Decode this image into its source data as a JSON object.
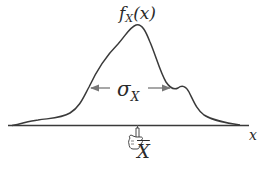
{
  "diagram": {
    "type": "probability-density-curve",
    "labels": {
      "density_function": "f",
      "density_subscript": "X",
      "density_argument": "(x)",
      "spread_symbol": "σ",
      "spread_subscript": "X",
      "axis_variable": "x",
      "mean_symbol": "X"
    },
    "marker": {
      "icon": "pointing-hand-icon",
      "points_to": "mean"
    },
    "colors": {
      "curve": "#3a3a3a",
      "axis": "#3a3a3a",
      "arrow": "#777777",
      "text": "#2a2a2a"
    }
  }
}
